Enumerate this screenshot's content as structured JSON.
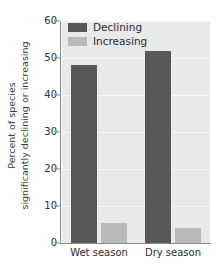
{
  "chart_data": {
    "type": "bar",
    "title": "",
    "xlabel": "",
    "ylabel_lines": [
      "Percent of species",
      "significantly declining or increasing"
    ],
    "ylabel": "Percent of species significantly declining or increasing",
    "categories": [
      "Wet season",
      "Dry season"
    ],
    "series": [
      {
        "name": "Declining",
        "values": [
          48,
          52
        ],
        "color": "#585858"
      },
      {
        "name": "Increasing",
        "values": [
          5.5,
          4
        ],
        "color": "#b9b9b9"
      }
    ],
    "ylim": [
      0,
      60
    ],
    "yticks": [
      0,
      10,
      20,
      30,
      40,
      50,
      60
    ],
    "ytick_labels": [
      "0",
      "10",
      "20",
      "30",
      "40",
      "50",
      "60"
    ],
    "grid": true,
    "grid_color": "#f7f7f7",
    "legend_position": "top-left",
    "plot_background": "#e9e9e9",
    "axis_color": "#8a8a8a"
  }
}
